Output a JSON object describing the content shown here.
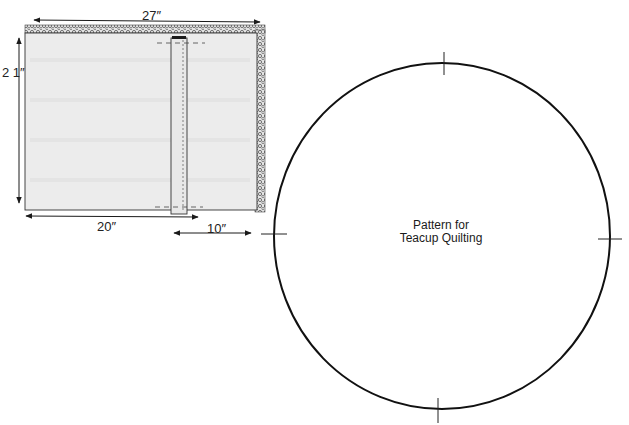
{
  "diagram": {
    "fabric": {
      "dimensions": {
        "width_top": "27″",
        "height_left": "2 1″",
        "bottom_left": "20″",
        "bottom_right": "10″"
      }
    },
    "pattern": {
      "label_line1": "Pattern for",
      "label_line2": "Teacup Quilting"
    },
    "colors": {
      "fabric_fill": "#ececec",
      "line": "#1a1a1a",
      "texture": "#555555"
    }
  }
}
